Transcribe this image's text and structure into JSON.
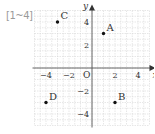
{
  "problem_label": "[1~4]",
  "chart_data": {
    "type": "scatter",
    "title": "",
    "xlabel": "x",
    "ylabel": "y",
    "origin_label": "O",
    "xlim": [
      -5,
      5
    ],
    "ylim": [
      -5,
      5
    ],
    "grid": true,
    "x_ticks": [
      {
        "value": -4,
        "label": "−4"
      },
      {
        "value": -2,
        "label": "−2"
      },
      {
        "value": 2,
        "label": "2"
      },
      {
        "value": 4,
        "label": "4"
      }
    ],
    "y_ticks": [
      {
        "value": 4,
        "label": "4"
      },
      {
        "value": 2,
        "label": "2"
      },
      {
        "value": -2,
        "label": "−2"
      },
      {
        "value": -4,
        "label": "−4"
      }
    ],
    "points": [
      {
        "name": "A",
        "x": 1,
        "y": 3
      },
      {
        "name": "B",
        "x": 2,
        "y": -3
      },
      {
        "name": "C",
        "x": -3,
        "y": 4
      },
      {
        "name": "D",
        "x": -4,
        "y": -3
      }
    ]
  }
}
